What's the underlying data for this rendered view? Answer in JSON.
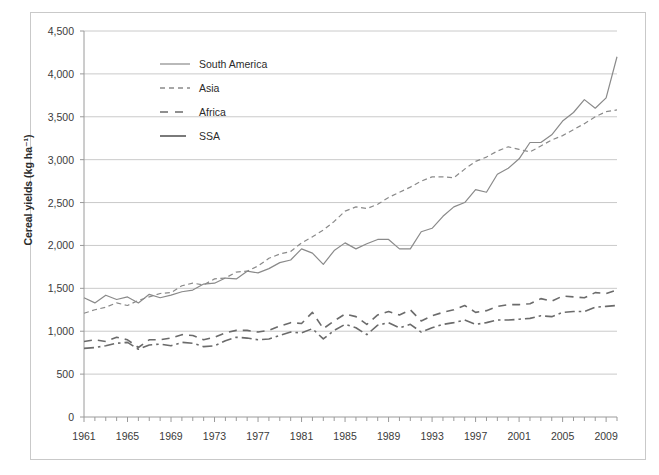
{
  "chart_data": {
    "type": "line",
    "title": "",
    "xlabel": "",
    "ylabel": "Cereal yields (kg ha-1)",
    "ylabel_display": "Cereal yields (kg ha⁻¹)",
    "xlim": [
      1961,
      2010
    ],
    "ylim": [
      0,
      4500
    ],
    "ytick_step": 500,
    "grid": "horizontal",
    "legend_position": "upper-left-inside",
    "yticks": [
      "0",
      "500",
      "1,000",
      "1,500",
      "2,000",
      "2,500",
      "3,000",
      "3,500",
      "4,000",
      "4,500"
    ],
    "ytick_values": [
      0,
      500,
      1000,
      1500,
      2000,
      2500,
      3000,
      3500,
      4000,
      4500
    ],
    "xticks": [
      "1961",
      "1965",
      "1969",
      "1973",
      "1977",
      "1981",
      "1985",
      "1989",
      "1993",
      "1997",
      "2001",
      "2005",
      "2009"
    ],
    "xtick_values": [
      1961,
      1965,
      1969,
      1973,
      1977,
      1981,
      1985,
      1989,
      1993,
      1997,
      2001,
      2005,
      2009
    ],
    "xtick_minor_step": 1,
    "x": [
      1961,
      1962,
      1963,
      1964,
      1965,
      1966,
      1967,
      1968,
      1969,
      1970,
      1971,
      1972,
      1973,
      1974,
      1975,
      1976,
      1977,
      1978,
      1979,
      1980,
      1981,
      1982,
      1983,
      1984,
      1985,
      1986,
      1987,
      1988,
      1989,
      1990,
      1991,
      1992,
      1993,
      1994,
      1995,
      1996,
      1997,
      1998,
      1999,
      2000,
      2001,
      2002,
      2003,
      2004,
      2005,
      2006,
      2007,
      2008,
      2009,
      2010
    ],
    "series": [
      {
        "name": "South America",
        "style": "solid",
        "color": "#8a8a8a",
        "width": 1.2,
        "values": [
          1390,
          1330,
          1420,
          1370,
          1400,
          1330,
          1430,
          1390,
          1420,
          1460,
          1480,
          1550,
          1560,
          1620,
          1610,
          1700,
          1680,
          1730,
          1800,
          1830,
          1960,
          1910,
          1780,
          1940,
          2030,
          1960,
          2020,
          2070,
          2070,
          1960,
          1960,
          2160,
          2200,
          2340,
          2450,
          2500,
          2650,
          2620,
          2830,
          2900,
          3010,
          3200,
          3200,
          3290,
          3450,
          3550,
          3700,
          3600,
          3720,
          4200
        ]
      },
      {
        "name": "Asia",
        "style": "dashed-small",
        "color": "#8a8a8a",
        "width": 1.2,
        "values": [
          1210,
          1250,
          1280,
          1330,
          1300,
          1360,
          1400,
          1440,
          1450,
          1530,
          1560,
          1540,
          1610,
          1620,
          1690,
          1700,
          1760,
          1850,
          1900,
          1930,
          2030,
          2100,
          2180,
          2280,
          2400,
          2450,
          2430,
          2480,
          2560,
          2620,
          2680,
          2750,
          2800,
          2800,
          2790,
          2890,
          2980,
          3030,
          3100,
          3150,
          3120,
          3090,
          3160,
          3230,
          3280,
          3350,
          3420,
          3500,
          3560,
          3580
        ]
      },
      {
        "name": "Africa",
        "style": "dashed-large",
        "color": "#6b6b6b",
        "width": 1.6,
        "values": [
          880,
          900,
          880,
          930,
          900,
          810,
          900,
          900,
          920,
          960,
          950,
          900,
          930,
          980,
          1010,
          1010,
          990,
          1010,
          1060,
          1100,
          1090,
          1220,
          1030,
          1120,
          1200,
          1170,
          1080,
          1190,
          1230,
          1190,
          1250,
          1120,
          1180,
          1220,
          1250,
          1300,
          1220,
          1240,
          1290,
          1310,
          1310,
          1320,
          1380,
          1350,
          1410,
          1400,
          1390,
          1450,
          1440,
          1480
        ]
      },
      {
        "name": "SSA",
        "style": "dash-dot",
        "color": "#6b6b6b",
        "width": 1.6,
        "values": [
          800,
          810,
          830,
          860,
          870,
          790,
          840,
          850,
          830,
          870,
          860,
          820,
          830,
          890,
          930,
          920,
          900,
          910,
          950,
          990,
          980,
          1030,
          910,
          1010,
          1080,
          1040,
          960,
          1070,
          1100,
          1040,
          1080,
          990,
          1040,
          1080,
          1100,
          1130,
          1080,
          1100,
          1130,
          1130,
          1140,
          1150,
          1180,
          1170,
          1220,
          1230,
          1230,
          1280,
          1290,
          1300
        ]
      }
    ]
  },
  "legend": {
    "items": [
      {
        "label": "South America",
        "style": "solid"
      },
      {
        "label": "Asia",
        "style": "dashed-small"
      },
      {
        "label": "Africa",
        "style": "dashed-large"
      },
      {
        "label": "SSA",
        "style": "solid-thick"
      }
    ]
  }
}
